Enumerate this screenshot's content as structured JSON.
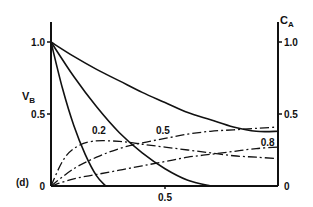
{
  "chart_data": {
    "type": "line",
    "panel_label": "(d)",
    "title": "",
    "xlabel": "",
    "ylabel_left": "V_B",
    "ylabel_right": "C_A",
    "xlim": [
      0,
      1.0
    ],
    "ylim_left": [
      0,
      1.0
    ],
    "ylim_right": [
      0,
      1.0
    ],
    "x_ticks": [
      {
        "value": 0.5,
        "label": "0.5"
      }
    ],
    "y_ticks_left": [
      {
        "value": 0,
        "label": "0"
      },
      {
        "value": 0.5,
        "label": "0.5"
      },
      {
        "value": 1.0,
        "label": "1.0"
      }
    ],
    "y_ticks_right": [
      {
        "value": 0,
        "label": "0"
      },
      {
        "value": 0.5,
        "label": "0.5"
      },
      {
        "value": 1.0,
        "label": "1.0"
      }
    ],
    "grid": false,
    "legend": "none (curves labeled inline with parameter values)",
    "series": [
      {
        "name": "V_B (0.2)",
        "style": "solid",
        "axis": "left",
        "param": "0.2",
        "x": [
          0,
          0.05,
          0.1,
          0.15,
          0.2,
          0.24
        ],
        "y": [
          1.0,
          0.68,
          0.42,
          0.22,
          0.07,
          0.0
        ]
      },
      {
        "name": "V_B (0.5)",
        "style": "solid",
        "axis": "left",
        "param": "0.5",
        "x": [
          0,
          0.1,
          0.2,
          0.3,
          0.4,
          0.5,
          0.6,
          0.7
        ],
        "y": [
          1.0,
          0.76,
          0.55,
          0.37,
          0.23,
          0.12,
          0.04,
          0.0
        ]
      },
      {
        "name": "V_B (0.8)",
        "style": "solid",
        "axis": "left",
        "param": "0.8",
        "x": [
          0,
          0.1,
          0.2,
          0.3,
          0.4,
          0.5,
          0.6,
          0.7,
          0.8,
          0.9,
          1.0
        ],
        "y": [
          1.0,
          0.9,
          0.81,
          0.73,
          0.65,
          0.58,
          0.51,
          0.46,
          0.41,
          0.38,
          0.38
        ]
      },
      {
        "name": "C_A (0.2)",
        "style": "dash-dot",
        "axis": "right",
        "param": "0.2",
        "x": [
          0,
          0.05,
          0.1,
          0.18,
          0.3,
          0.4,
          0.5,
          0.6,
          0.7,
          0.8,
          0.9,
          1.0
        ],
        "y": [
          0,
          0.17,
          0.26,
          0.31,
          0.31,
          0.29,
          0.27,
          0.25,
          0.23,
          0.21,
          0.2,
          0.19
        ]
      },
      {
        "name": "C_A (0.5)",
        "style": "dash-dot",
        "axis": "right",
        "param": "0.5",
        "x": [
          0,
          0.1,
          0.2,
          0.3,
          0.4,
          0.5,
          0.6,
          0.7,
          0.8,
          0.9,
          1.0
        ],
        "y": [
          0,
          0.12,
          0.2,
          0.26,
          0.3,
          0.33,
          0.36,
          0.38,
          0.39,
          0.4,
          0.41
        ]
      },
      {
        "name": "C_A (0.8)",
        "style": "dash-dot",
        "axis": "right",
        "param": "0.8",
        "x": [
          0,
          0.1,
          0.2,
          0.3,
          0.4,
          0.5,
          0.6,
          0.7,
          0.8,
          0.9,
          1.0
        ],
        "y": [
          0,
          0.05,
          0.08,
          0.11,
          0.14,
          0.17,
          0.2,
          0.22,
          0.24,
          0.26,
          0.27
        ]
      }
    ],
    "curve_labels": [
      {
        "text": "0.2",
        "x": 0.18,
        "y": 0.36
      },
      {
        "text": "0.5",
        "x": 0.46,
        "y": 0.36
      },
      {
        "text": "0.8",
        "x": 0.92,
        "y": 0.28
      }
    ]
  }
}
